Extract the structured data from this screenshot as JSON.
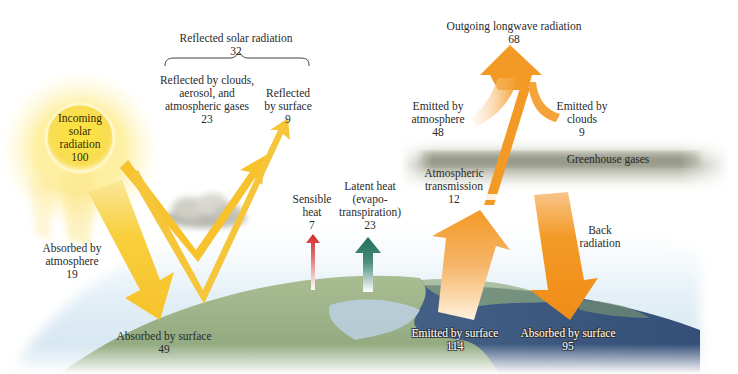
{
  "diagram": {
    "colors": {
      "solar": "#f7c22b",
      "longwave": "#f39a26",
      "sensible_heat": "#d93a3a",
      "latent_heat": "#1f6e5c",
      "ocean": "#3d5c86",
      "land": "#9fb38a",
      "sky": "#dbeaf3",
      "greenhouse_band": "#9a9c88"
    },
    "sun": {
      "lines": [
        "Incoming",
        "solar",
        "radiation"
      ],
      "value": "100"
    },
    "reflected_total": {
      "label": "Reflected solar radiation",
      "value": "32"
    },
    "reflected_clouds": {
      "lines": [
        "Reflected by clouds,",
        "aerosol, and",
        "atmospheric gases"
      ],
      "value": "23"
    },
    "reflected_surface": {
      "lines": [
        "Reflected",
        "by surface"
      ],
      "value": "9"
    },
    "absorbed_atmosphere": {
      "lines": [
        "Absorbed by",
        "atmosphere"
      ],
      "value": "19"
    },
    "absorbed_surface_solar": {
      "label": "Absorbed by surface",
      "value": "49"
    },
    "sensible_heat": {
      "lines": [
        "Sensible",
        "heat"
      ],
      "value": "7"
    },
    "latent_heat": {
      "lines": [
        "Latent heat",
        "(evapo-",
        "transpiration)"
      ],
      "value": "23"
    },
    "outgoing_longwave": {
      "label": "Outgoing longwave radiation",
      "value": "68"
    },
    "emitted_atmosphere": {
      "lines": [
        "Emitted by",
        "atmosphere"
      ],
      "value": "48"
    },
    "emitted_clouds": {
      "lines": [
        "Emitted by",
        "clouds"
      ],
      "value": "9"
    },
    "greenhouse": {
      "label": "Greenhouse gases"
    },
    "atmos_transmission": {
      "lines": [
        "Atmospheric",
        "transmission"
      ],
      "value": "12"
    },
    "back_radiation": {
      "lines": [
        "Back",
        "radiation"
      ]
    },
    "emitted_surface": {
      "label": "Emitted by surface",
      "value": "114"
    },
    "absorbed_surface_back": {
      "label": "Absorbed by surface",
      "value": "95"
    }
  }
}
